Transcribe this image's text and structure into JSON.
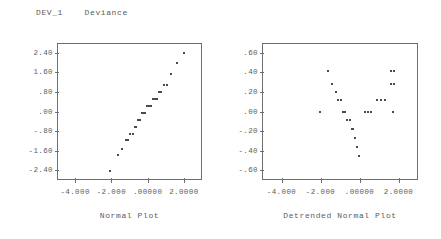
{
  "header": {
    "variable_name": "DEV_1",
    "variable_label": "Deviance",
    "title_text": "DEV_1    Deviance"
  },
  "chart_data": [
    {
      "type": "scatter",
      "id": "normal-plot",
      "title": "Normal Plot",
      "xlabel": "Normal Plot",
      "ylabel": "",
      "xlim": [
        -5.0,
        3.0
      ],
      "ylim": [
        -2.8,
        2.8
      ],
      "grid": false,
      "legend": false,
      "xticks": [
        -4.0,
        -2.0,
        0.0,
        2.0
      ],
      "xticklabels": [
        "-4.000",
        "-2.000",
        ".00000",
        "2.0000"
      ],
      "yticks": [
        2.4,
        1.6,
        0.8,
        0.0,
        -0.8,
        -1.6,
        -2.4
      ],
      "yticklabels": [
        "2.40",
        "1.60",
        ".80",
        ".00",
        "-.80",
        "-1.60",
        "-2.40"
      ],
      "points": [
        [
          -2.05,
          -2.42
        ],
        [
          -1.62,
          -1.79
        ],
        [
          -1.4,
          -1.52
        ],
        [
          -1.22,
          -1.18
        ],
        [
          -1.08,
          -1.18
        ],
        [
          -0.95,
          -0.9
        ],
        [
          -0.83,
          -0.9
        ],
        [
          -0.72,
          -0.62
        ],
        [
          -0.62,
          -0.62
        ],
        [
          -0.51,
          -0.34
        ],
        [
          -0.41,
          -0.34
        ],
        [
          -0.31,
          -0.06
        ],
        [
          -0.22,
          -0.06
        ],
        [
          -0.12,
          -0.06
        ],
        [
          -0.03,
          0.22
        ],
        [
          0.07,
          0.22
        ],
        [
          0.17,
          0.22
        ],
        [
          0.27,
          0.5
        ],
        [
          0.38,
          0.5
        ],
        [
          0.49,
          0.5
        ],
        [
          0.62,
          0.78
        ],
        [
          0.75,
          0.78
        ],
        [
          0.92,
          1.1
        ],
        [
          1.08,
          1.1
        ],
        [
          1.3,
          1.52
        ],
        [
          1.62,
          2.0
        ],
        [
          2.0,
          2.38
        ]
      ]
    },
    {
      "type": "scatter",
      "id": "detrended-normal-plot",
      "title": "Detrended Normal Plot",
      "xlabel": "Detrended Normal Plot",
      "ylabel": "",
      "xlim": [
        -5.0,
        3.0
      ],
      "ylim": [
        -0.7,
        0.7
      ],
      "grid": false,
      "legend": false,
      "xticks": [
        -4.0,
        -2.0,
        0.0,
        2.0
      ],
      "xticklabels": [
        "-4.000",
        "-2.000",
        ".00000",
        "2.0000"
      ],
      "yticks": [
        0.6,
        0.4,
        0.2,
        0.0,
        -0.2,
        -0.4,
        -0.6
      ],
      "yticklabels": [
        ".60",
        ".40",
        ".20",
        ".00",
        "-.20",
        "-.40",
        "-.60"
      ],
      "points": [
        [
          -2.05,
          0.0
        ],
        [
          -1.62,
          0.41
        ],
        [
          -1.4,
          0.28
        ],
        [
          -1.22,
          0.2
        ],
        [
          -1.08,
          0.12
        ],
        [
          -0.95,
          0.12
        ],
        [
          -0.83,
          0.0
        ],
        [
          -0.72,
          0.0
        ],
        [
          -0.62,
          -0.09
        ],
        [
          -0.51,
          -0.09
        ],
        [
          -0.41,
          -0.18
        ],
        [
          -0.31,
          -0.18
        ],
        [
          -0.22,
          -0.27
        ],
        [
          -0.12,
          -0.36
        ],
        [
          -0.03,
          -0.45
        ],
        [
          0.3,
          0.0
        ],
        [
          0.45,
          0.0
        ],
        [
          0.6,
          0.0
        ],
        [
          0.92,
          0.12
        ],
        [
          1.08,
          0.12
        ],
        [
          1.3,
          0.12
        ],
        [
          1.62,
          0.28
        ],
        [
          1.78,
          0.28
        ],
        [
          1.62,
          0.41
        ],
        [
          1.78,
          0.41
        ],
        [
          1.7,
          0.0
        ]
      ]
    }
  ]
}
